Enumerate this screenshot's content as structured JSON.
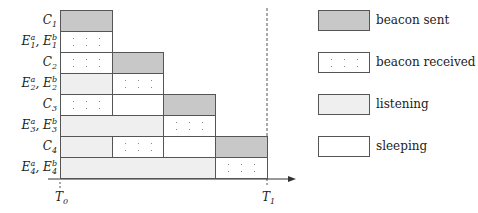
{
  "diagram": {
    "axis": {
      "start_label": "T",
      "start_sub": "0",
      "end_label": "T",
      "end_sub": "1"
    },
    "rows": [
      {
        "id": "C1",
        "label": "C",
        "sub": "1",
        "type": "single"
      },
      {
        "id": "E1",
        "label": "E",
        "sub": "1",
        "type": "pair"
      },
      {
        "id": "C2",
        "label": "C",
        "sub": "2",
        "type": "single"
      },
      {
        "id": "E2",
        "label": "E",
        "sub": "2",
        "type": "pair"
      },
      {
        "id": "C3",
        "label": "C",
        "sub": "3",
        "type": "single"
      },
      {
        "id": "E3",
        "label": "E",
        "sub": "3",
        "type": "pair"
      },
      {
        "id": "C4",
        "label": "C",
        "sub": "4",
        "type": "single"
      },
      {
        "id": "E4",
        "label": "E",
        "sub": "4",
        "type": "pair"
      }
    ],
    "pair_superscripts": {
      "a": "a",
      "b": "b",
      "separator": ", "
    },
    "segments": [
      {
        "row": 0,
        "start": 0,
        "end": 1,
        "state": "sent"
      },
      {
        "row": 1,
        "start": 0,
        "end": 1,
        "state": "received"
      },
      {
        "row": 2,
        "start": 0,
        "end": 1,
        "state": "received"
      },
      {
        "row": 2,
        "start": 1,
        "end": 2,
        "state": "sent"
      },
      {
        "row": 3,
        "start": 0,
        "end": 1,
        "state": "listening"
      },
      {
        "row": 3,
        "start": 1,
        "end": 2,
        "state": "received"
      },
      {
        "row": 4,
        "start": 0,
        "end": 1,
        "state": "received"
      },
      {
        "row": 4,
        "start": 1,
        "end": 2,
        "state": "sleeping"
      },
      {
        "row": 4,
        "start": 2,
        "end": 3,
        "state": "sent"
      },
      {
        "row": 5,
        "start": 0,
        "end": 2,
        "state": "listening"
      },
      {
        "row": 5,
        "start": 2,
        "end": 3,
        "state": "received"
      },
      {
        "row": 6,
        "start": 0,
        "end": 1,
        "state": "listening"
      },
      {
        "row": 6,
        "start": 1,
        "end": 2,
        "state": "received"
      },
      {
        "row": 6,
        "start": 2,
        "end": 3,
        "state": "sleeping"
      },
      {
        "row": 6,
        "start": 3,
        "end": 4,
        "state": "sent"
      },
      {
        "row": 7,
        "start": 0,
        "end": 3,
        "state": "listening"
      },
      {
        "row": 7,
        "start": 3,
        "end": 4,
        "state": "received"
      }
    ]
  },
  "legend": [
    {
      "state": "sent",
      "label": "beacon sent"
    },
    {
      "state": "received",
      "label": "beacon received"
    },
    {
      "state": "listening",
      "label": "listening"
    },
    {
      "state": "sleeping",
      "label": "sleeping"
    }
  ],
  "colors": {
    "sent": "#c8c8c8",
    "listening": "#efefef",
    "sleeping": "#ffffff",
    "border": "#555555",
    "axis": "#333333"
  }
}
